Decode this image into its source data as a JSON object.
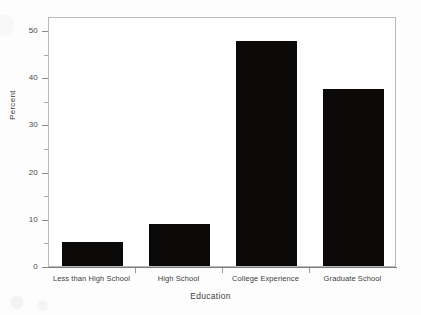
{
  "chart_data": {
    "type": "bar",
    "title": "",
    "subtitle": "",
    "xlabel": "Education",
    "ylabel": "Percent",
    "categories": [
      "Less than High School",
      "High School",
      "College Experience",
      "Graduate School"
    ],
    "values": [
      5,
      9,
      47.8,
      37.5
    ],
    "ylim": [
      0,
      53
    ],
    "yticks": [
      0,
      10,
      20,
      30,
      40,
      50
    ],
    "ytick_labels": [
      "0",
      "10",
      "20",
      "30",
      "40",
      "50"
    ],
    "yminor_ticks": [
      5,
      15,
      25,
      35,
      45
    ],
    "grid": false,
    "legend": null,
    "bar_color": "#0b0a08",
    "frame_color": "#b9b9b9",
    "background": "#ffffff"
  },
  "axes": {
    "y_title": "Percent",
    "x_title": "Education"
  }
}
